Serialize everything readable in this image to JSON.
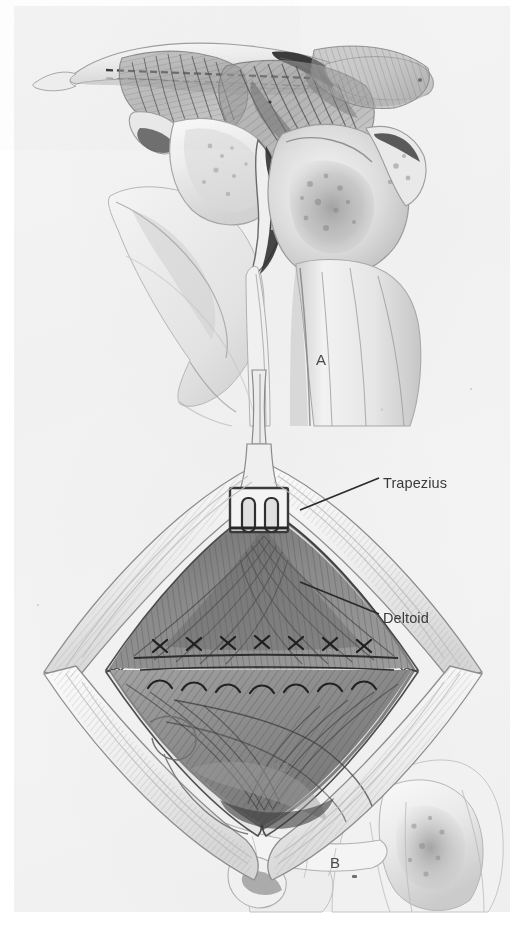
{
  "figure": {
    "kind": "surgical-anatomy-illustration",
    "medium": "graphite pencil drawing, grayscale scan",
    "paper_color": "#f2f2f2",
    "ink_color": "#3a3a3a",
    "panels": [
      {
        "id": "A",
        "letter": "A",
        "caption": "",
        "description": "Lateral view of the shoulder showing clavicle, acromion, coracoid process, glenohumeral joint and humeral head with the dashed osteotomy / incision line along the clavicle and acromion, and the converging deltoid and trapezius muscle fibers."
      },
      {
        "id": "B",
        "letter": "B",
        "caption": "",
        "description": "Diamond-shaped surgical wound held open, two-prong self-retaining retractor at the apex, sutured deltotrapezial fascia, exposing the trapezius above and the deltoid below."
      }
    ],
    "labels": [
      {
        "text": "Trapezius",
        "panel": "B",
        "leader": "line from label left edge down-left to the trapezius muscle belly"
      },
      {
        "text": "Deltoid",
        "panel": "B",
        "leader": "line from label left edge up-left to the deltoid muscle belly"
      }
    ],
    "artist_signature": "O.Z."
  }
}
